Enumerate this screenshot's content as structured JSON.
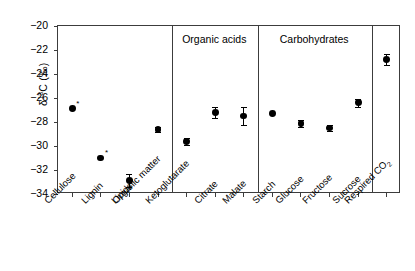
{
  "chart_data": {
    "type": "scatter",
    "title": "",
    "xlabel": "",
    "ylabel": "δ13C (‰)",
    "ylabel_prefix": "δ",
    "ylabel_sup": "13",
    "ylabel_suffix": "C (‰)",
    "ylim": [
      -34,
      -20
    ],
    "yticks": [
      -20,
      -22,
      -24,
      -26,
      -28,
      -30,
      -32,
      -34
    ],
    "ytick_labels": [
      "−20",
      "−22",
      "−24",
      "−26",
      "−28",
      "−30",
      "−32",
      "−34"
    ],
    "grid": false,
    "legend": "none",
    "marker": "filled-circle",
    "marker_color": "#000000",
    "frame_color": "#3c3c3c",
    "categories": [
      "Cellulose",
      "Lignin",
      "Lipids",
      "Organic matter",
      "Ketoglutarate",
      "Citrate",
      "Malate",
      "Starch",
      "Glucose",
      "Fructose",
      "Sucrose",
      "Respired CO2"
    ],
    "points": [
      {
        "label": "Cellulose",
        "value": -26.9,
        "err": 0.0,
        "note": "*"
      },
      {
        "label": "Lignin",
        "value": -31.0,
        "err": 0.0,
        "note": "*"
      },
      {
        "label": "Lipids",
        "value": -32.9,
        "err": 0.55,
        "note": ""
      },
      {
        "label": "Organic matter",
        "value": -28.6,
        "err": 0.2,
        "note": ""
      },
      {
        "label": "Ketoglutarate",
        "value": -29.6,
        "err": 0.3,
        "note": ""
      },
      {
        "label": "Citrate",
        "value": -27.2,
        "err": 0.45,
        "note": ""
      },
      {
        "label": "Malate",
        "value": -27.5,
        "err": 0.75,
        "note": ""
      },
      {
        "label": "Starch",
        "value": -27.3,
        "err": 0.0,
        "note": ""
      },
      {
        "label": "Glucose",
        "value": -28.1,
        "err": 0.3,
        "note": ""
      },
      {
        "label": "Fructose",
        "value": -28.5,
        "err": 0.25,
        "note": ""
      },
      {
        "label": "Sucrose",
        "value": -26.4,
        "err": 0.35,
        "note": ""
      },
      {
        "label": "Respired CO2",
        "value": -22.8,
        "err": 0.45,
        "note": ""
      }
    ],
    "panels": [
      {
        "header": "",
        "categories": [
          "Cellulose",
          "Lignin",
          "Lipids",
          "Organic matter"
        ]
      },
      {
        "header": "Organic acids",
        "categories": [
          "Ketoglutarate",
          "Citrate",
          "Malate"
        ]
      },
      {
        "header": "Carbohydrates",
        "categories": [
          "Starch",
          "Glucose",
          "Fructose",
          "Sucrose"
        ]
      },
      {
        "header": "",
        "categories": [
          "Respired CO2"
        ]
      }
    ]
  },
  "axis": {
    "y_title_prefix": "δ",
    "y_title_sup": "13",
    "y_title_suffix": "C (‰)"
  },
  "labels": {
    "cellulose": "Cellulose",
    "lignin": "Lignin",
    "lipids": "Lipids",
    "organic_matter": "Organic matter",
    "ketoglutarate": "Ketoglutarate",
    "citrate": "Citrate",
    "malate": "Malate",
    "starch": "Starch",
    "glucose": "Glucose",
    "fructose": "Fructose",
    "sucrose": "Sucrose",
    "respired_co2_main": "Respired CO",
    "respired_co2_sub": "2"
  },
  "panel_headers": {
    "organic_acids": "Organic acids",
    "carbohydrates": "Carbohydrates"
  }
}
